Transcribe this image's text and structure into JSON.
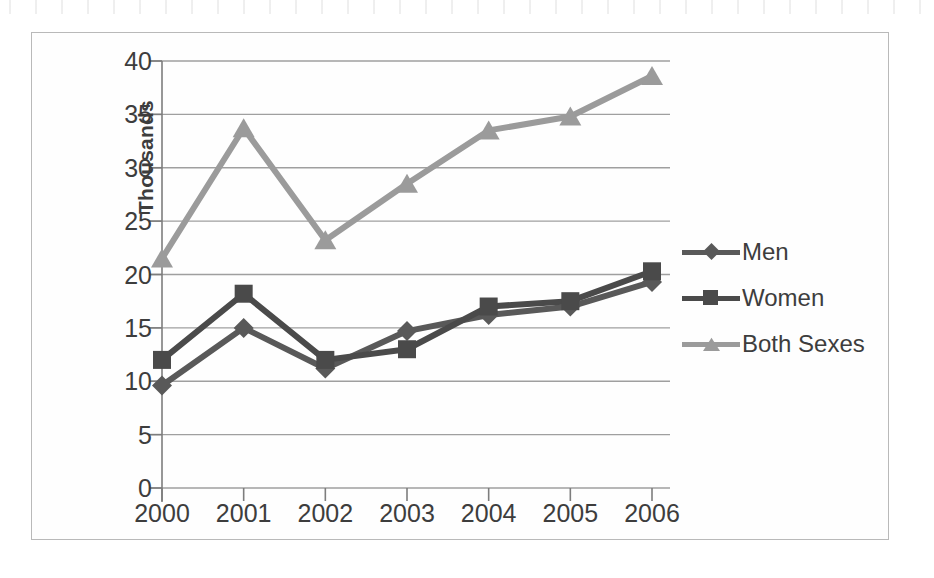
{
  "chart_data": {
    "type": "line",
    "title": "",
    "xlabel": "",
    "ylabel": "Thousands",
    "categories": [
      "2000",
      "2001",
      "2002",
      "2003",
      "2004",
      "2005",
      "2006"
    ],
    "x": [
      2000,
      2001,
      2002,
      2003,
      2004,
      2005,
      2006
    ],
    "ylim": [
      0,
      40
    ],
    "yticks": [
      0,
      5,
      10,
      15,
      20,
      25,
      30,
      35,
      40
    ],
    "ytick_labels": [
      "0",
      "5",
      "10",
      "15",
      "20",
      "25",
      "30",
      "35",
      "40"
    ],
    "grid": true,
    "legend_position": "right",
    "series": [
      {
        "name": "Men",
        "marker": "diamond",
        "color": "#595959",
        "values": [
          9.6,
          15.0,
          11.2,
          14.7,
          16.2,
          17.0,
          19.3
        ]
      },
      {
        "name": "Women",
        "marker": "square",
        "color": "#4a4a4a",
        "values": [
          12.0,
          18.2,
          12.0,
          13.0,
          17.0,
          17.5,
          20.3
        ]
      },
      {
        "name": "Both Sexes",
        "marker": "triangle",
        "color": "#9b9b9b",
        "values": [
          21.5,
          33.7,
          23.2,
          28.5,
          33.5,
          34.8,
          38.6
        ]
      }
    ]
  },
  "axis": {
    "y_title": "Thousands"
  },
  "legend": {
    "items": [
      {
        "label": "Men"
      },
      {
        "label": "Women"
      },
      {
        "label": "Both Sexes"
      }
    ]
  },
  "colors": {
    "men": "#595959",
    "women": "#4a4a4a",
    "both_sexes": "#9b9b9b",
    "grid": "#9f9f9f",
    "axis": "#7d7d7d",
    "text": "#3d3d3d",
    "frame": "#b9b9b9",
    "background": "#fefefe"
  }
}
